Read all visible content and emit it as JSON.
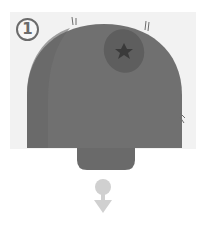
{
  "figure": {
    "step_number": "1",
    "colors": {
      "panel": "#f2f2f2",
      "dome": "#707070",
      "dome_shadow": "#666666",
      "lesion": "#5e5e5e",
      "lesion_core": "#3a3a3a",
      "stem": "#6a6a6a",
      "arrow": "#d0d0d0",
      "step_badge": "#6b6b6b"
    },
    "icons": {
      "step_badge": "circled-number",
      "arrow": "down-arrow-icon",
      "lesion": "lesion-icon"
    }
  }
}
